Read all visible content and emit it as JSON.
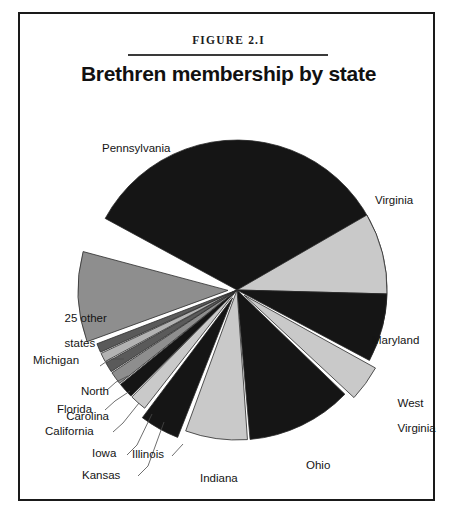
{
  "figure": {
    "number": "FIGURE 2.I",
    "title": "Brethren membership by state"
  },
  "colors": {
    "black": "#151515",
    "light_gray": "#c9c9c9",
    "mid_gray": "#8e8e8e",
    "dark_gray": "#5a5a5a",
    "pale_gray": "#b3b3b3",
    "outline": "#2b2b2b",
    "background": "#ffffff",
    "frame": "#1a1a1a",
    "text": "#141414"
  },
  "chart_data": {
    "type": "pie",
    "title": "Brethren membership by state",
    "xlabel": "",
    "ylabel": "",
    "legend_position": "none",
    "grid": false,
    "categories": [
      "Pennsylvania",
      "Virginia",
      "Maryland",
      "West Virginia",
      "Ohio",
      "Indiana",
      "Illinois",
      "Kansas",
      "Iowa",
      "California",
      "Florida",
      "North Carolina",
      "Michigan",
      "25 other states"
    ],
    "values": [
      29.5,
      17.0,
      7.5,
      4.0,
      11.5,
      7.0,
      4.5,
      1.9,
      1.7,
      1.5,
      1.2,
      1.1,
      1.0,
      10.6
    ],
    "slices": [
      {
        "label": "Pennsylvania",
        "value": 29.5,
        "start_deg": 298.5,
        "end_deg": 104.0,
        "fill": "black",
        "exploded": false,
        "label_x": 82,
        "label_y": 128,
        "leader": false
      },
      {
        "label": "Virginia",
        "value": 17.0,
        "start_deg": 60.0,
        "end_deg": 91.5,
        "fill": "light_gray",
        "exploded": false,
        "label_x": 370,
        "label_y": 186,
        "leader": false
      },
      {
        "label": "Maryland",
        "value": 7.5,
        "start_deg": 91.5,
        "end_deg": 118.0,
        "fill": "black",
        "exploded": false,
        "label_x": 366,
        "label_y": 327,
        "leader": false
      },
      {
        "label": "West Virginia",
        "value": 4.0,
        "start_deg": 119.0,
        "end_deg": 133.0,
        "fill": "light_gray",
        "exploded": true,
        "label_x": 368,
        "label_y": 382,
        "leader": false
      },
      {
        "label": "Ohio",
        "value": 11.5,
        "start_deg": 134.0,
        "end_deg": 175.0,
        "fill": "black",
        "exploded": false,
        "label_x": 299,
        "label_y": 452,
        "leader": false
      },
      {
        "label": "Indiana",
        "value": 7.0,
        "start_deg": 176.0,
        "end_deg": 200.0,
        "fill": "light_gray",
        "exploded": false,
        "label_x": 193,
        "label_y": 465,
        "leader": false
      },
      {
        "label": "Illinois",
        "value": 4.5,
        "start_deg": 201.5,
        "end_deg": 217.0,
        "fill": "black",
        "exploded": true,
        "label_x": 118,
        "label_y": 441,
        "leader": true,
        "leader_path": "M152,442 L163,430"
      },
      {
        "label": "Kansas",
        "value": 1.9,
        "start_deg": 218.0,
        "end_deg": 224.5,
        "fill": "light_gray",
        "exploded": false,
        "label_x": 68,
        "label_y": 462,
        "leader": true,
        "leader_path": "M118,462 L128,452 L144,408"
      },
      {
        "label": "Iowa",
        "value": 1.7,
        "start_deg": 225.0,
        "end_deg": 231.0,
        "fill": "black",
        "exploded": false,
        "label_x": 77,
        "label_y": 440,
        "leader": true,
        "leader_path": "M107,441 L117,431 L132,400"
      },
      {
        "label": "California",
        "value": 1.5,
        "start_deg": 231.5,
        "end_deg": 236.5,
        "fill": "mid_gray",
        "exploded": false,
        "label_x": 31,
        "label_y": 418,
        "leader": true,
        "leader_path": "M93,418 L103,409 L119,389"
      },
      {
        "label": "Florida",
        "value": 1.2,
        "start_deg": 237.0,
        "end_deg": 241.0,
        "fill": "dark_gray",
        "exploded": false,
        "label_x": 38,
        "label_y": 396,
        "leader": true,
        "leader_path": "M85,396 L95,387 L110,377"
      },
      {
        "label": "North\nCarolina",
        "value": 1.1,
        "start_deg": 241.5,
        "end_deg": 245.0,
        "fill": "pale_gray",
        "exploded": false,
        "label_x": 30,
        "label_y": 365,
        "leader": true,
        "leader_path": "M87,376 L96,368 L108,362"
      },
      {
        "label": "Michigan",
        "value": 1.0,
        "start_deg": 245.5,
        "end_deg": 249.0,
        "fill": "dark_gray",
        "exploded": false,
        "label_x": 18,
        "label_y": 347,
        "leader": true,
        "leader_path": "M80,352 L90,345 L104,345"
      },
      {
        "label": "25 other\nstates",
        "value": 10.6,
        "start_deg": 250.0,
        "end_deg": 285.0,
        "fill": "mid_gray",
        "exploded": true,
        "label_x": 22,
        "label_y": 291,
        "leader": false
      }
    ],
    "geometry": {
      "center_x": 217,
      "center_y": 276,
      "radius": 150
    }
  },
  "labels": {
    "pennsylvania": "Pennsylvania",
    "virginia": "Virginia",
    "maryland": "Maryland",
    "west_virginia_line1": "West",
    "west_virginia_line2": "Virginia",
    "ohio": "Ohio",
    "indiana": "Indiana",
    "illinois": "Illinois",
    "kansas": "Kansas",
    "iowa": "Iowa",
    "california": "California",
    "florida": "Florida",
    "north_carolina_line1": "North",
    "north_carolina_line2": "Carolina",
    "michigan": "Michigan",
    "other_line1": "25 other",
    "other_line2": "states"
  }
}
